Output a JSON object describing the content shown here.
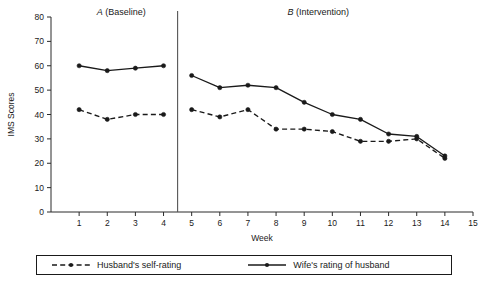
{
  "chart_data": {
    "type": "line",
    "title": "",
    "xlabel": "Week",
    "ylabel": "IMS Scores",
    "xlim": [
      0,
      15
    ],
    "ylim": [
      0,
      80
    ],
    "x_ticks": [
      1,
      2,
      3,
      4,
      5,
      6,
      7,
      8,
      9,
      10,
      11,
      12,
      13,
      14,
      15
    ],
    "y_ticks": [
      0,
      10,
      20,
      30,
      40,
      50,
      60,
      70,
      80
    ],
    "grid": false,
    "legend_position": "bottom",
    "phases": [
      {
        "id": "A",
        "letter": "A",
        "name": "(Baseline)",
        "label": "A (Baseline)",
        "weeks": [
          1,
          2,
          3,
          4
        ]
      },
      {
        "id": "B",
        "letter": "B",
        "name": "(Intervention)",
        "label": "B (Intervention)",
        "weeks": [
          5,
          6,
          7,
          8,
          9,
          10,
          11,
          12,
          13,
          14
        ]
      }
    ],
    "phase_divider_x": 4.5,
    "series": [
      {
        "name": "Husband's self-rating",
        "style": "dashed",
        "x": [
          1,
          2,
          3,
          4,
          5,
          6,
          7,
          8,
          9,
          10,
          11,
          12,
          13,
          14
        ],
        "values": [
          42,
          38,
          40,
          40,
          42,
          39,
          42,
          34,
          34,
          33,
          29,
          29,
          30,
          22
        ]
      },
      {
        "name": "Wife's rating of husband",
        "style": "solid",
        "x": [
          1,
          2,
          3,
          4,
          5,
          6,
          7,
          8,
          9,
          10,
          11,
          12,
          13,
          14
        ],
        "values": [
          60,
          58,
          59,
          60,
          56,
          51,
          52,
          51,
          45,
          40,
          38,
          32,
          31,
          23
        ]
      }
    ]
  },
  "legend": {
    "items": [
      {
        "label": "Husband's self-rating",
        "style": "dashed"
      },
      {
        "label": "Wife's rating of husband",
        "style": "solid"
      }
    ]
  }
}
